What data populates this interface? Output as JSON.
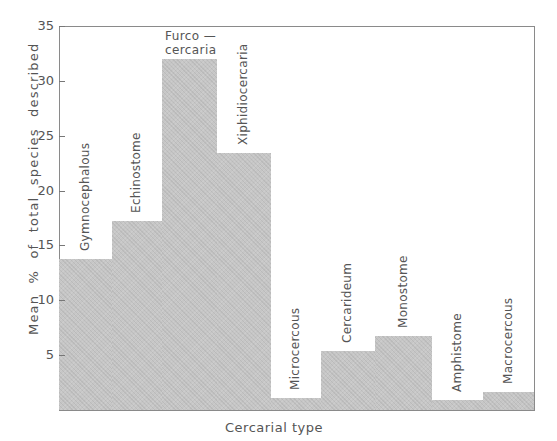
{
  "chart_data": {
    "type": "bar",
    "title": "",
    "xlabel": "Cercarial type",
    "ylabel": "Mean % of total species described",
    "ylim": [
      0,
      35
    ],
    "yticks": [
      5,
      10,
      15,
      20,
      25,
      30,
      35
    ],
    "ytick_labels": [
      "5",
      "10",
      "15",
      "20",
      "25",
      "30",
      "35"
    ],
    "grid": false,
    "legend": null,
    "bar_color": "#c6c6c6",
    "categories": [
      "Gymnocephalous",
      "Echinostome",
      "Furcocercaria",
      "Xiphidiocercaria",
      "Microcercous",
      "Cercarideum",
      "Monostome",
      "Amphistome",
      "Macrocercous"
    ],
    "category_labels": [
      "Gymnocephalous",
      "Echinostome",
      "Furco —\ncercaria",
      "Xiphidiocercaria",
      "Microcercous",
      "Cercarideum",
      "Monostome",
      "Amphistome",
      "Macrocercous"
    ],
    "values": [
      13.8,
      17.2,
      32.0,
      23.4,
      1.1,
      5.4,
      6.7,
      0.9,
      1.6
    ]
  }
}
